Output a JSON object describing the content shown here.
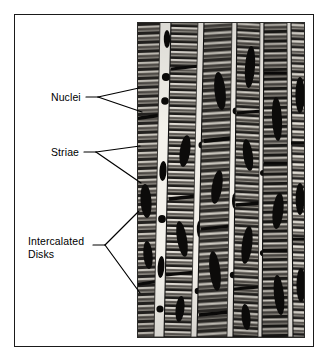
{
  "figure": {
    "type": "light-micrograph",
    "frame_color": "#1a1a1a",
    "background_color": "#ffffff",
    "photo_tone": "black-and-white halftone"
  },
  "labels": [
    {
      "id": "nuclei",
      "text": "Nuclei",
      "leader": {
        "style": "forked",
        "origin": [
          98,
          97
        ],
        "tips": [
          [
            139,
            88
          ],
          [
            142,
            112
          ]
        ]
      }
    },
    {
      "id": "striae",
      "text": "Striae",
      "leader": {
        "style": "forked",
        "origin": [
          96,
          152
        ],
        "tips": [
          [
            140,
            146
          ],
          [
            141,
            183
          ]
        ]
      }
    },
    {
      "id": "intercalated-disks",
      "text": "Intercalated\nDisks",
      "leader": {
        "style": "forked",
        "origin": [
          105,
          245
        ],
        "tips": [
          [
            139,
            211
          ],
          [
            140,
            293
          ]
        ]
      }
    }
  ],
  "micrograph": {
    "x": 137,
    "y": 22,
    "width": 168,
    "height": 316,
    "fiber_count": 7,
    "features": [
      "cross-striations (striae) banding across each fiber",
      "dark oval nuclei within fibers",
      "heavy dark transverse intercalated disks"
    ]
  }
}
